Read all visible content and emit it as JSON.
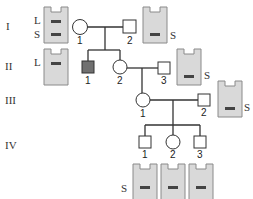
{
  "generations": [
    {
      "label": "I"
    },
    {
      "label": "II"
    },
    {
      "label": "III"
    },
    {
      "label": "IV"
    }
  ],
  "individuals": {
    "I_1": {
      "number": "1",
      "sex": "female",
      "affected": false
    },
    "I_2": {
      "number": "2",
      "sex": "male",
      "affected": false
    },
    "II_1": {
      "number": "1",
      "sex": "male",
      "affected": true
    },
    "II_2": {
      "number": "2",
      "sex": "female",
      "affected": false
    },
    "II_3": {
      "number": "3",
      "sex": "male",
      "affected": false
    },
    "III_1": {
      "number": "1",
      "sex": "female",
      "affected": false
    },
    "III_2": {
      "number": "2",
      "sex": "male",
      "affected": false
    },
    "IV_1": {
      "number": "1",
      "sex": "male",
      "affected": false
    },
    "IV_2": {
      "number": "2",
      "sex": "female",
      "affected": false
    },
    "IV_3": {
      "number": "3",
      "sex": "male",
      "affected": false
    }
  },
  "gels": {
    "gen1_left": {
      "bands": [
        "L",
        "S"
      ]
    },
    "gen1_right": {
      "bands": [
        "S"
      ]
    },
    "gen2_left": {
      "bands": [
        "L"
      ]
    },
    "gen2_right": {
      "bands": [
        "S"
      ]
    },
    "gen3_right": {
      "bands": [
        "S"
      ]
    },
    "gen4": {
      "bands": [
        "S"
      ]
    }
  },
  "band_labels": {
    "L": "L",
    "S": "S"
  },
  "colors": {
    "line": "#333333",
    "gel_fill": "#d9d9d9",
    "gel_border": "#8a8a8a",
    "band": "#444444",
    "affected": "#707070"
  }
}
